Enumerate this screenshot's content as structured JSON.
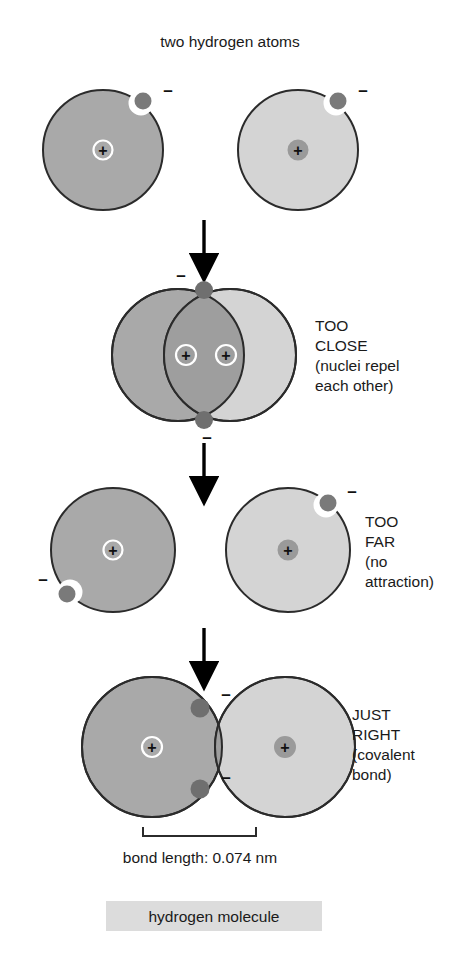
{
  "figure": {
    "title": "two hydrogen atoms",
    "bond_length_label": "bond length: 0.074 nm",
    "molecule_label": "hydrogen molecule"
  },
  "symbols": {
    "proton": "+",
    "electron": "–"
  },
  "colors": {
    "atom_dark_fill": "#a9a9a9",
    "atom_light_fill": "#d4d4d4",
    "outline": "#2b2b2b",
    "electron_dot": "#7a7a7a",
    "electron_halo": "#ffffff",
    "nucleus_ring_dark": "#ffffff",
    "nucleus_ring_light": "#8f8f8f",
    "arrow": "#000000",
    "label_highlight_bg": "#dcdcdc",
    "text": "#1a1a1a"
  },
  "stages": [
    {
      "id": "separate-atoms",
      "heading": "two hydrogen atoms",
      "annotation_lines": []
    },
    {
      "id": "too-close",
      "heading": "TOO CLOSE",
      "annotation_lines": [
        "TOO",
        "CLOSE",
        "(nuclei repel",
        "each other)"
      ]
    },
    {
      "id": "too-far",
      "heading": "TOO FAR",
      "annotation_lines": [
        "TOO",
        "FAR",
        "(no",
        "attraction)"
      ]
    },
    {
      "id": "just-right",
      "heading": "JUST RIGHT",
      "annotation_lines": [
        "JUST",
        "RIGHT",
        "(covalent",
        "bond)"
      ]
    }
  ],
  "annotations": {
    "too_close": {
      "line1": "TOO",
      "line2": "CLOSE",
      "line3": "(nuclei repel",
      "line4": "each other)"
    },
    "too_far": {
      "line1": "TOO",
      "line2": "FAR",
      "line3": "(no",
      "line4": "attraction)"
    },
    "just_right": {
      "line1": "JUST",
      "line2": "RIGHT",
      "line3": "(covalent",
      "line4": "bond)"
    }
  },
  "measurement": {
    "label": "bond length: 0.074 nm",
    "value": "0.074",
    "unit": "nm"
  }
}
